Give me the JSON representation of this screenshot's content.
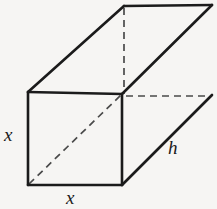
{
  "figure": {
    "type": "rectangular-box-diagram",
    "background_color": "#f6f5f3",
    "line_color": "#1b1b1b",
    "hidden_line_color": "#4a4a4a",
    "labels": [
      {
        "id": "x-height",
        "text": "x",
        "meaning": "height of square front face",
        "x": 12,
        "y": 135
      },
      {
        "id": "x-width",
        "text": "x",
        "meaning": "width of square front face",
        "x": 74,
        "y": 197
      },
      {
        "id": "h-depth",
        "text": "h",
        "meaning": "depth of the box",
        "x": 176,
        "y": 148
      }
    ],
    "vertices": {
      "front_top_left": [
        28,
        92
      ],
      "front_top_right": [
        122,
        94
      ],
      "front_bottom_left": [
        28,
        185
      ],
      "front_bottom_right": [
        122,
        185
      ],
      "back_top_left": [
        124,
        6
      ],
      "back_top_right": [
        212,
        5
      ],
      "back_bottom_right": [
        212,
        95
      ]
    },
    "solid_edges": [
      {
        "name": "front-top-edge",
        "from": "front_top_left",
        "to": "front_top_right"
      },
      {
        "name": "front-left-edge",
        "from": "front_top_left",
        "to": "front_bottom_left"
      },
      {
        "name": "front-bottom-edge",
        "from": "front_bottom_left",
        "to": "front_bottom_right"
      },
      {
        "name": "front-right-edge",
        "from": "front_top_right",
        "to": "front_bottom_right"
      },
      {
        "name": "top-left-receding-edge",
        "from": "front_top_left",
        "to": "back_top_left"
      },
      {
        "name": "back-top-edge",
        "from": "back_top_left",
        "to": "back_top_right"
      },
      {
        "name": "top-right-receding-edge",
        "from": "front_top_right",
        "to": "back_top_right"
      },
      {
        "name": "bottom-right-receding-edge",
        "from": "front_bottom_right",
        "to": "back_bottom_right"
      }
    ],
    "dashed_edges": [
      {
        "name": "hidden-vertical-back-edge",
        "from": "back_top_left",
        "to": [
          124,
          95
        ]
      },
      {
        "name": "hidden-horizontal-back-edge",
        "from": [
          124,
          96
        ],
        "to": "back_bottom_right"
      },
      {
        "name": "front-face-diagonal",
        "from": "front_bottom_left",
        "to": "front_top_right"
      }
    ]
  }
}
